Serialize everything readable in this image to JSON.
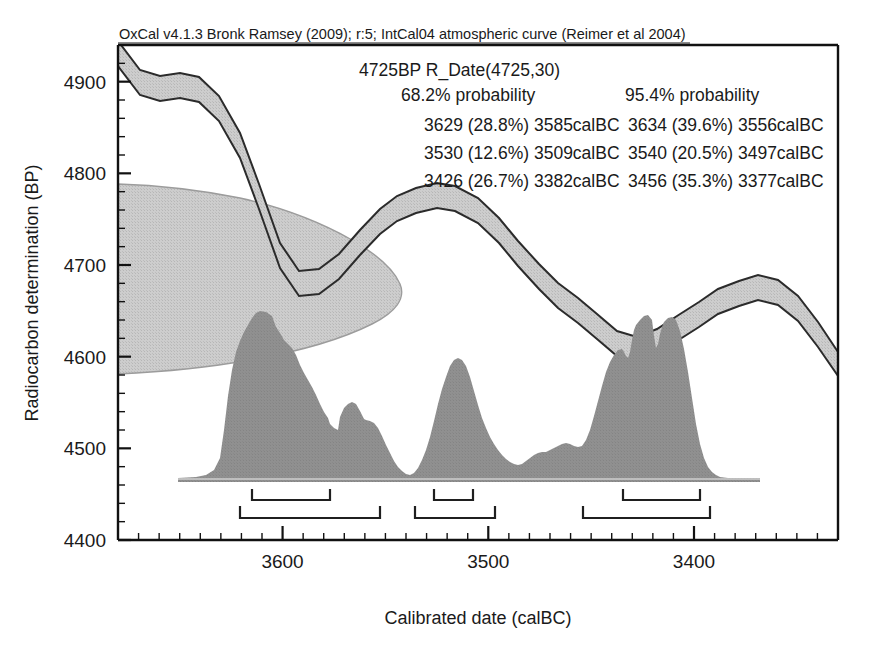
{
  "header": {
    "credit_line": "OxCal v4.1.3 Bronk Ramsey (2009); r:5; IntCal04 atmospheric curve (Reimer et al 2004)"
  },
  "annotation": {
    "sample_line": "4725BP R_Date(4725,30)",
    "col68_title": "68.2% probability",
    "col95_title": "95.4% probability",
    "ranges_68": [
      "3629 (28.8%) 3585calBC",
      "3530 (12.6%) 3509calBC",
      "3426 (26.7%) 3382calBC"
    ],
    "ranges_95": [
      "3634 (39.6%) 3556calBC",
      "3540 (20.5%) 3497calBC",
      "3456 (35.3%) 3377calBC"
    ]
  },
  "axes": {
    "ylabel": "Radiocarbon determination (BP)",
    "xlabel": "Calibrated date (calBC)",
    "y_ticks": [
      "4900",
      "4800",
      "4700",
      "4600",
      "4500",
      "4400"
    ],
    "x_ticks": [
      "3600",
      "3500",
      "3400"
    ]
  },
  "colors": {
    "ink": "#1a1a1a",
    "curve_band_fill": "#c9c9c9",
    "curve_band_stroke": "#2b2b2b",
    "posterior_fill": "#8d8d8d",
    "prior_fill": "#cfcfcf",
    "prior_stroke": "#9a9a9a",
    "background": "#ffffff"
  },
  "chart_data": {
    "type": "area",
    "title": "OxCal v4.1.3 Bronk Ramsey (2009); r:5; IntCal04 atmospheric curve (Reimer et al 2004)",
    "xlabel": "Calibrated date (calBC)",
    "ylabel": "Radiocarbon determination (BP)",
    "xlim": [
      3680,
      3330
    ],
    "ylim": [
      4400,
      4940
    ],
    "x_tick_values": [
      3600,
      3500,
      3400
    ],
    "y_tick_values": [
      4900,
      4800,
      4700,
      4600,
      4500,
      4400
    ],
    "x_minor_tick_step": 10,
    "y_minor_tick_step": 20,
    "grid": false,
    "legend": "none",
    "measurement": {
      "label": "R_Date(4725,30)",
      "bp": 4725,
      "sigma": 30
    },
    "series": [
      {
        "name": "IntCal04 calibration curve (mean)",
        "type": "line",
        "x": [
          3680,
          3670,
          3660,
          3650,
          3640,
          3630,
          3620,
          3610,
          3600,
          3590,
          3580,
          3570,
          3560,
          3550,
          3540,
          3530,
          3520,
          3510,
          3500,
          3490,
          3480,
          3470,
          3460,
          3450,
          3440,
          3430,
          3420,
          3410,
          3400,
          3390,
          3380,
          3370,
          3360,
          3350,
          3340,
          3330
        ],
        "values": [
          4930,
          4905,
          4901,
          4899,
          4893,
          4878,
          4855,
          4820,
          4780,
          4742,
          4718,
          4709,
          4713,
          4722,
          4737,
          4757,
          4773,
          4783,
          4787,
          4782,
          4768,
          4748,
          4726,
          4710,
          4702,
          4690,
          4672,
          4660,
          4662,
          4678,
          4692,
          4700,
          4706,
          4712,
          4704,
          4684
        ]
      },
      {
        "name": "IntCal04 calibration curve (+1 sigma)",
        "type": "line",
        "x": [
          3680,
          3660,
          3640,
          3620,
          3600,
          3580,
          3560,
          3540,
          3520,
          3500,
          3480,
          3460,
          3440,
          3420,
          3400,
          3380,
          3360,
          3340,
          3330
        ],
        "values": [
          4941,
          4913,
          4905,
          4868,
          4793,
          4730,
          4724,
          4748,
          4784,
          4797,
          4778,
          4737,
          4713,
          4684,
          4674,
          4703,
          4717,
          4715,
          4695
        ]
      },
      {
        "name": "IntCal04 calibration curve (-1 sigma)",
        "type": "line",
        "x": [
          3680,
          3660,
          3640,
          3620,
          3600,
          3580,
          3560,
          3540,
          3520,
          3500,
          3480,
          3460,
          3440,
          3420,
          3400,
          3380,
          3360,
          3340,
          3330
        ],
        "values": [
          4919,
          4889,
          4881,
          4842,
          4767,
          4706,
          4702,
          4726,
          4762,
          4777,
          4758,
          4715,
          4691,
          4660,
          4650,
          4681,
          4695,
          4693,
          4673
        ]
      },
      {
        "name": "Measurement likelihood (normal, 4725 +/- 30 BP)",
        "type": "area",
        "orientation": "horizontal",
        "mean": 4725,
        "sigma": 30,
        "note": "Gaussian drawn against the y-axis at the left edge of the plot"
      },
      {
        "name": "Calibrated probability distribution",
        "type": "area",
        "x": [
          3670,
          3660,
          3650,
          3645,
          3640,
          3636,
          3632,
          3628,
          3624,
          3620,
          3616,
          3612,
          3608,
          3604,
          3600,
          3596,
          3592,
          3588,
          3584,
          3580,
          3576,
          3572,
          3568,
          3564,
          3560,
          3556,
          3552,
          3548,
          3544,
          3540,
          3536,
          3532,
          3528,
          3524,
          3520,
          3516,
          3512,
          3508,
          3504,
          3500,
          3496,
          3492,
          3488,
          3484,
          3480,
          3476,
          3472,
          3468,
          3464,
          3460,
          3456,
          3452,
          3448,
          3444,
          3440,
          3436,
          3432,
          3428,
          3424,
          3420,
          3416,
          3412,
          3408,
          3404,
          3400,
          3396,
          3392,
          3388,
          3384,
          3380,
          3376,
          3372,
          3368,
          3360,
          3350,
          3340
        ],
        "values": [
          0.0,
          0.01,
          0.02,
          0.04,
          0.1,
          0.3,
          0.55,
          0.7,
          0.76,
          0.8,
          0.86,
          0.93,
          0.98,
          1.0,
          0.97,
          0.92,
          0.86,
          0.8,
          0.76,
          0.73,
          0.66,
          0.56,
          0.46,
          0.38,
          0.3,
          0.24,
          0.26,
          0.29,
          0.31,
          0.3,
          0.29,
          0.28,
          0.27,
          0.25,
          0.21,
          0.16,
          0.11,
          0.07,
          0.05,
          0.05,
          0.07,
          0.12,
          0.22,
          0.36,
          0.52,
          0.66,
          0.77,
          0.82,
          0.76,
          0.64,
          0.47,
          0.33,
          0.25,
          0.21,
          0.2,
          0.2,
          0.21,
          0.23,
          0.25,
          0.24,
          0.26,
          0.33,
          0.45,
          0.58,
          0.7,
          0.78,
          0.85,
          0.93,
          0.83,
          0.55,
          0.22,
          0.06,
          0.02,
          0.01,
          0.0,
          0.0
        ],
        "note": "Relative probability density, arbitrary units peaking at 1.0"
      }
    ],
    "range_bars": [
      {
        "level": "68.2%",
        "from": 3629,
        "to": 3585,
        "probability": 28.8
      },
      {
        "level": "68.2%",
        "from": 3530,
        "to": 3509,
        "probability": 12.6
      },
      {
        "level": "68.2%",
        "from": 3426,
        "to": 3382,
        "probability": 26.7
      },
      {
        "level": "95.4%",
        "from": 3634,
        "to": 3556,
        "probability": 39.6
      },
      {
        "level": "95.4%",
        "from": 3540,
        "to": 3497,
        "probability": 20.5
      },
      {
        "level": "95.4%",
        "from": 3456,
        "to": 3377,
        "probability": 35.3
      }
    ]
  }
}
